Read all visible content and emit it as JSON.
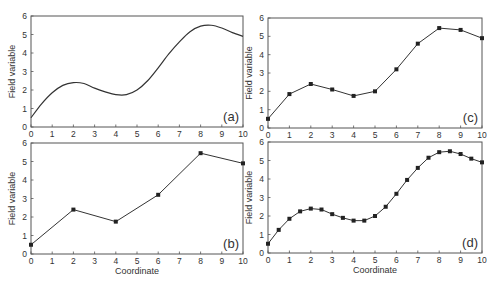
{
  "figure": {
    "xlabel": "Coordinate",
    "ylabel": "Field variable",
    "line_color": "#333333"
  },
  "chart_data": [
    {
      "panel": "(a)",
      "type": "line",
      "style": "smooth curve, no markers",
      "xlabel": "",
      "ylabel": "Field variable",
      "xlim": [
        0,
        10
      ],
      "ylim": [
        0,
        6
      ],
      "xticks": [
        0,
        1,
        2,
        3,
        4,
        5,
        6,
        7,
        8,
        9,
        10
      ],
      "yticks": [
        0,
        1,
        2,
        3,
        4,
        5,
        6
      ],
      "x": [
        0,
        0.5,
        1,
        1.5,
        2,
        2.5,
        3,
        3.5,
        4,
        4.5,
        5,
        5.5,
        6,
        6.5,
        7,
        7.5,
        8,
        8.5,
        9,
        9.5,
        10
      ],
      "y": [
        0.5,
        1.25,
        1.85,
        2.25,
        2.4,
        2.35,
        2.1,
        1.9,
        1.75,
        1.75,
        2.0,
        2.5,
        3.2,
        3.95,
        4.6,
        5.15,
        5.45,
        5.5,
        5.35,
        5.1,
        4.9
      ]
    },
    {
      "panel": "(b)",
      "type": "line",
      "style": "straight segments with square markers",
      "xlabel": "Coordinate",
      "ylabel": "Field variable",
      "xlim": [
        0,
        10
      ],
      "ylim": [
        0,
        6
      ],
      "xticks": [
        0,
        1,
        2,
        3,
        4,
        5,
        6,
        7,
        8,
        9,
        10
      ],
      "yticks": [
        0,
        1,
        2,
        3,
        4,
        5,
        6
      ],
      "x": [
        0,
        2,
        4,
        6,
        8,
        10
      ],
      "y": [
        0.5,
        2.4,
        1.75,
        3.2,
        5.45,
        4.9
      ]
    },
    {
      "panel": "(c)",
      "type": "line",
      "style": "straight segments with square markers",
      "xlabel": "",
      "ylabel": "Field variable",
      "xlim": [
        0,
        10
      ],
      "ylim": [
        0,
        6
      ],
      "xticks": [
        0,
        1,
        2,
        3,
        4,
        5,
        6,
        7,
        8,
        9,
        10
      ],
      "yticks": [
        0,
        1,
        2,
        3,
        4,
        5,
        6
      ],
      "x": [
        0,
        1,
        2,
        3,
        4,
        5,
        6,
        7,
        8,
        9,
        10
      ],
      "y": [
        0.5,
        1.85,
        2.4,
        2.1,
        1.75,
        2.0,
        3.2,
        4.6,
        5.45,
        5.35,
        4.9
      ]
    },
    {
      "panel": "(d)",
      "type": "line",
      "style": "straight segments with square markers",
      "xlabel": "Coordinate",
      "ylabel": "Field variable",
      "xlim": [
        0,
        10
      ],
      "ylim": [
        0,
        6
      ],
      "xticks": [
        0,
        1,
        2,
        3,
        4,
        5,
        6,
        7,
        8,
        9,
        10
      ],
      "yticks": [
        0,
        1,
        2,
        3,
        4,
        5,
        6
      ],
      "x": [
        0,
        0.5,
        1,
        1.5,
        2,
        2.5,
        3,
        3.5,
        4,
        4.5,
        5,
        5.5,
        6,
        6.5,
        7,
        7.5,
        8,
        8.5,
        9,
        9.5,
        10
      ],
      "y": [
        0.5,
        1.25,
        1.85,
        2.25,
        2.4,
        2.35,
        2.1,
        1.9,
        1.75,
        1.75,
        2.0,
        2.5,
        3.2,
        3.95,
        4.6,
        5.15,
        5.45,
        5.5,
        5.35,
        5.1,
        4.9
      ]
    }
  ],
  "panels_layout": [
    {
      "left": 31,
      "top": 16,
      "right": 243,
      "bottom": 127,
      "show_xlabel": false,
      "markers": false,
      "smooth": true
    },
    {
      "left": 31,
      "top": 143,
      "right": 243,
      "bottom": 254,
      "show_xlabel": true,
      "markers": true,
      "smooth": false
    },
    {
      "left": 268,
      "top": 18,
      "right": 482,
      "bottom": 128,
      "show_xlabel": false,
      "markers": true,
      "smooth": false
    },
    {
      "left": 268,
      "top": 142,
      "right": 482,
      "bottom": 253,
      "show_xlabel": true,
      "markers": true,
      "smooth": false
    }
  ]
}
